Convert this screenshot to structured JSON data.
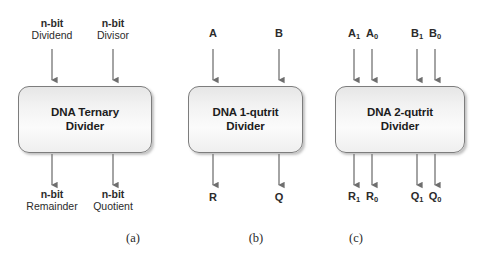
{
  "figure": {
    "background_color": "#ffffff",
    "box_border_color": "#7d7d7d",
    "text_color": "#1d1d1d",
    "arrow_color": "#6e6e6e"
  },
  "panels": [
    {
      "id": "a",
      "caption": "(a)",
      "block_label": "DNA Ternary\nDivider",
      "inputs": [
        {
          "name": "dividend",
          "line1": "n-bit",
          "line2": "Dividend"
        },
        {
          "name": "divisor",
          "line1": "n-bit",
          "line2": "Divisor"
        }
      ],
      "outputs": [
        {
          "name": "remainder",
          "line1": "n-bit",
          "line2": "Remainder"
        },
        {
          "name": "quotient",
          "line1": "n-bit",
          "line2": "Quotient"
        }
      ]
    },
    {
      "id": "b",
      "caption": "(b)",
      "block_label": "DNA 1-qutrit\nDivider",
      "inputs": [
        {
          "name": "a",
          "text": "A"
        },
        {
          "name": "b",
          "text": "B"
        }
      ],
      "outputs": [
        {
          "name": "r",
          "text": "R"
        },
        {
          "name": "q",
          "text": "Q"
        }
      ]
    },
    {
      "id": "c",
      "caption": "(c)",
      "block_label": "DNA 2-qutrit\nDivider",
      "inputs": [
        {
          "name": "a1",
          "base": "A",
          "sub": "1"
        },
        {
          "name": "a0",
          "base": "A",
          "sub": "0"
        },
        {
          "name": "b1",
          "base": "B",
          "sub": "1"
        },
        {
          "name": "b0",
          "base": "B",
          "sub": "0"
        }
      ],
      "outputs": [
        {
          "name": "r1",
          "base": "R",
          "sub": "1"
        },
        {
          "name": "r0",
          "base": "R",
          "sub": "0"
        },
        {
          "name": "q1",
          "base": "Q",
          "sub": "1"
        },
        {
          "name": "q0",
          "base": "Q",
          "sub": "0"
        }
      ]
    }
  ]
}
